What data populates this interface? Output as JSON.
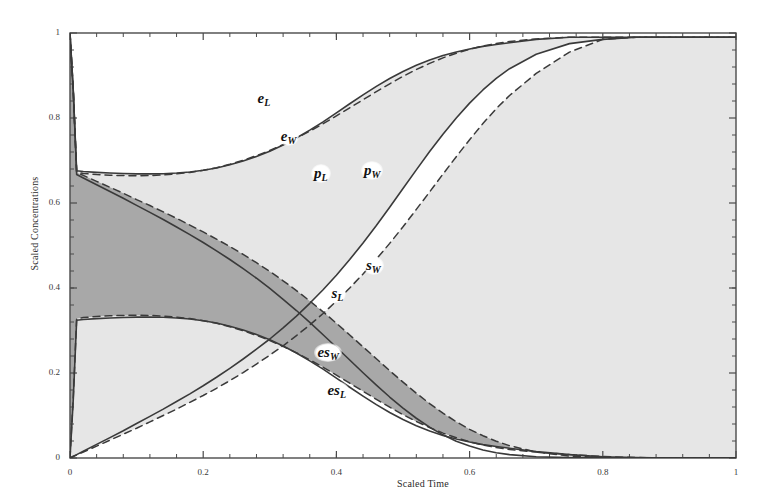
{
  "chart_data": {
    "type": "line",
    "title": "",
    "xlabel": "Scaled Time",
    "ylabel": "Scaled Concentrations",
    "xlim": [
      0,
      1
    ],
    "ylim": [
      0,
      1
    ],
    "xticks": [
      "0",
      "0.2",
      "0.4",
      "0.6",
      "0.8",
      "1"
    ],
    "xtick_values": [
      0,
      0.2,
      0.4,
      0.6,
      0.8,
      1
    ],
    "yticks": [
      "0",
      "0.2",
      "0.4",
      "0.6",
      "0.8",
      "1"
    ],
    "ytick_values": [
      0,
      0.2,
      0.4,
      0.6,
      0.8,
      1
    ],
    "grid": false,
    "legend": "inline-curve-labels",
    "minor_ticks": true,
    "frame": true,
    "colors": {
      "curve": "#3a3a3a",
      "fill_light": "#e6e6e6",
      "fill_dark": "#a8a8a8",
      "frame": "#4a4a4a",
      "text": "#2b2b2b"
    },
    "x": [
      0,
      0.005,
      0.01,
      0.02,
      0.04,
      0.06,
      0.08,
      0.1,
      0.12,
      0.14,
      0.16,
      0.18,
      0.2,
      0.22,
      0.24,
      0.26,
      0.28,
      0.3,
      0.32,
      0.34,
      0.36,
      0.38,
      0.4,
      0.42,
      0.44,
      0.46,
      0.48,
      0.5,
      0.52,
      0.54,
      0.56,
      0.58,
      0.6,
      0.62,
      0.64,
      0.66,
      0.7,
      0.75,
      0.8,
      0.85,
      0.9,
      0.95,
      1
    ],
    "series": [
      {
        "name": "e_L",
        "label": "e",
        "sublabel": "L",
        "style": "solid",
        "values": [
          1,
          0.86,
          0.676,
          0.674,
          0.672,
          0.6705,
          0.6695,
          0.6685,
          0.6685,
          0.669,
          0.6705,
          0.673,
          0.677,
          0.6825,
          0.69,
          0.699,
          0.7095,
          0.722,
          0.7365,
          0.753,
          0.7715,
          0.791,
          0.812,
          0.8335,
          0.8545,
          0.8745,
          0.893,
          0.9095,
          0.924,
          0.9365,
          0.947,
          0.9555,
          0.9625,
          0.9685,
          0.973,
          0.977,
          0.985,
          0.99,
          0.99,
          0.99,
          0.99,
          0.99,
          0.99
        ]
      },
      {
        "name": "e_W",
        "label": "e",
        "sublabel": "W",
        "style": "dashed",
        "values": [
          1,
          0.855,
          0.672,
          0.6695,
          0.667,
          0.6655,
          0.6645,
          0.664,
          0.6645,
          0.666,
          0.6685,
          0.672,
          0.677,
          0.683,
          0.691,
          0.7005,
          0.7115,
          0.7235,
          0.7375,
          0.7525,
          0.769,
          0.7865,
          0.805,
          0.824,
          0.843,
          0.862,
          0.8805,
          0.898,
          0.914,
          0.9285,
          0.9415,
          0.9525,
          0.962,
          0.9695,
          0.9755,
          0.98,
          0.986,
          0.99,
          0.99,
          0.99,
          0.99,
          0.99,
          0.99
        ]
      },
      {
        "name": "p_L",
        "label": "p",
        "sublabel": "L",
        "style": "solid",
        "values": [
          0,
          0.004,
          0.008,
          0.016,
          0.032,
          0.048,
          0.064,
          0.081,
          0.098,
          0.115,
          0.133,
          0.151,
          0.17,
          0.19,
          0.211,
          0.233,
          0.256,
          0.28,
          0.306,
          0.334,
          0.364,
          0.396,
          0.43,
          0.467,
          0.506,
          0.547,
          0.59,
          0.634,
          0.678,
          0.721,
          0.762,
          0.8,
          0.835,
          0.866,
          0.893,
          0.916,
          0.95,
          0.975,
          0.985,
          0.99,
          0.99,
          0.99,
          0.99
        ]
      },
      {
        "name": "p_W",
        "label": "p",
        "sublabel": "W",
        "style": "dashed",
        "values": [
          0,
          0.0035,
          0.007,
          0.014,
          0.028,
          0.042,
          0.056,
          0.07,
          0.085,
          0.1,
          0.115,
          0.131,
          0.147,
          0.164,
          0.182,
          0.201,
          0.221,
          0.242,
          0.264,
          0.288,
          0.313,
          0.34,
          0.369,
          0.4,
          0.433,
          0.468,
          0.505,
          0.544,
          0.585,
          0.626,
          0.668,
          0.709,
          0.749,
          0.787,
          0.822,
          0.853,
          0.905,
          0.955,
          0.985,
          0.99,
          0.99,
          0.99,
          0.99
        ]
      },
      {
        "name": "s_L",
        "label": "s",
        "sublabel": "L",
        "style": "solid",
        "values": [
          1,
          0.863,
          0.667,
          0.659,
          0.643,
          0.627,
          0.611,
          0.5945,
          0.578,
          0.561,
          0.5435,
          0.5255,
          0.507,
          0.4875,
          0.467,
          0.4455,
          0.423,
          0.399,
          0.3735,
          0.347,
          0.319,
          0.29,
          0.2605,
          0.2305,
          0.2005,
          0.1715,
          0.1435,
          0.1175,
          0.0935,
          0.0725,
          0.0545,
          0.0395,
          0.028,
          0.019,
          0.0125,
          0.008,
          0.003,
          0.0008,
          0.0002,
          0,
          0,
          0,
          0
        ]
      },
      {
        "name": "s_W",
        "label": "s",
        "sublabel": "W",
        "style": "dashed",
        "values": [
          1,
          0.867,
          0.672,
          0.665,
          0.651,
          0.637,
          0.623,
          0.608,
          0.594,
          0.579,
          0.564,
          0.548,
          0.532,
          0.515,
          0.4975,
          0.479,
          0.4595,
          0.439,
          0.417,
          0.394,
          0.3695,
          0.344,
          0.317,
          0.2895,
          0.2615,
          0.2335,
          0.2055,
          0.1785,
          0.1525,
          0.128,
          0.1055,
          0.0855,
          0.0675,
          0.0525,
          0.0395,
          0.029,
          0.014,
          0.0045,
          0.001,
          0,
          0,
          0,
          0
        ]
      },
      {
        "name": "es_L",
        "label": "es",
        "sublabel": "L",
        "style": "solid",
        "values": [
          0,
          0.14,
          0.324,
          0.326,
          0.328,
          0.3295,
          0.3305,
          0.3315,
          0.3315,
          0.331,
          0.3295,
          0.327,
          0.323,
          0.3175,
          0.31,
          0.301,
          0.2905,
          0.278,
          0.2635,
          0.247,
          0.2285,
          0.209,
          0.188,
          0.1665,
          0.1455,
          0.1255,
          0.107,
          0.0905,
          0.076,
          0.0635,
          0.053,
          0.0445,
          0.0375,
          0.0315,
          0.027,
          0.023,
          0.015,
          0.008,
          0.003,
          0.001,
          0,
          0,
          0
        ]
      },
      {
        "name": "es_W",
        "label": "es",
        "sublabel": "W",
        "style": "dashed",
        "values": [
          0,
          0.145,
          0.328,
          0.3305,
          0.333,
          0.3345,
          0.3355,
          0.336,
          0.3355,
          0.334,
          0.3315,
          0.328,
          0.323,
          0.317,
          0.309,
          0.2995,
          0.2885,
          0.2765,
          0.2625,
          0.2475,
          0.231,
          0.2135,
          0.195,
          0.176,
          0.157,
          0.138,
          0.1195,
          0.102,
          0.086,
          0.0715,
          0.0585,
          0.0475,
          0.038,
          0.0305,
          0.0245,
          0.02,
          0.014,
          0.008,
          0.0035,
          0.001,
          0,
          0,
          0
        ]
      }
    ],
    "curve_labels": [
      {
        "id": "e-L-label",
        "text": "e",
        "sub": "L",
        "x": 0.292,
        "y": 0.845
      },
      {
        "id": "e-W-label",
        "text": "e",
        "sub": "W",
        "x": 0.327,
        "y": 0.755
      },
      {
        "id": "p-L-label",
        "text": "p",
        "sub": "L",
        "x": 0.377,
        "y": 0.668
      },
      {
        "id": "p-W-label",
        "text": "p",
        "sub": "W",
        "x": 0.452,
        "y": 0.675
      },
      {
        "id": "s-W-label",
        "text": "s",
        "sub": "W",
        "x": 0.455,
        "y": 0.452
      },
      {
        "id": "s-L-label",
        "text": "s",
        "sub": "L",
        "x": 0.403,
        "y": 0.385
      },
      {
        "id": "es-W-label",
        "text": "es",
        "sub": "W",
        "x": 0.382,
        "y": 0.248
      },
      {
        "id": "es-L-label",
        "text": "es",
        "sub": "L",
        "x": 0.397,
        "y": 0.158
      }
    ],
    "shaded_bands": [
      {
        "name": "upper-light-band",
        "between": [
          "e_L",
          "e_W"
        ],
        "fill": "#e6e6e6"
      },
      {
        "name": "e-p-light-region",
        "fill": "#e6e6e6"
      },
      {
        "name": "s-band-dark",
        "between": [
          "s_L",
          "s_W"
        ],
        "fill": "#a8a8a8"
      },
      {
        "name": "es-band-light",
        "between": [
          "es_L",
          "es_W"
        ],
        "fill": "#efefef"
      }
    ]
  }
}
